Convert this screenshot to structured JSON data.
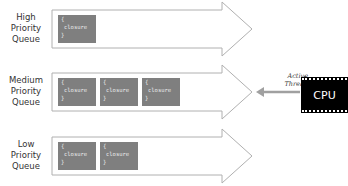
{
  "queues": [
    {
      "label_lines": [
        "High",
        "Priority",
        "Queue"
      ],
      "closures": 1
    },
    {
      "label_lines": [
        "Medium",
        "Priority",
        "Queue"
      ],
      "closures": 3
    },
    {
      "label_lines": [
        "Low",
        "Priority",
        "Queue"
      ],
      "closures": 2
    }
  ],
  "closure": {
    "open": "{",
    "word": "closure",
    "close": "}"
  },
  "cpu": {
    "label": "CPU"
  },
  "active_thread": {
    "line1": "Active",
    "line2": "Thread"
  },
  "colors": {
    "arrow_stroke": "#b0b0b0",
    "closure_fill": "#7f7f7f",
    "cpu_fill": "#000000",
    "pointer": "#a0a0a0"
  }
}
